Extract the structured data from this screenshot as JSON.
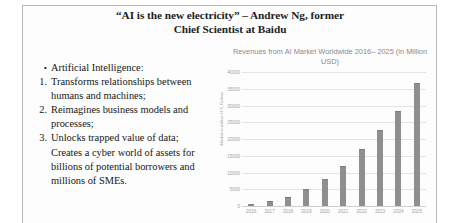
{
  "slide": {
    "title_lines": [
      "“AI is the new electricity” – Andrew Ng, former",
      "Chief Scientist at Baidu"
    ],
    "border_color": "#b9b9b9",
    "background": "#ffffff"
  },
  "content": {
    "items": [
      {
        "marker": "•",
        "marker_type": "bullet",
        "text": "Artificial Intelligence:"
      },
      {
        "marker": "1.",
        "marker_type": "number",
        "text": "Transforms relationships between humans and machines;"
      },
      {
        "marker": "2.",
        "marker_type": "number",
        "text": "Reimagines business models and processes;"
      },
      {
        "marker": "3.",
        "marker_type": "number",
        "text": "Unlocks trapped value of data; Creates a cyber world of assets for billions of potential borrowers and millions of SMEs."
      }
    ]
  },
  "chart_data": {
    "type": "bar",
    "title_lines": [
      "Revenues from AI Market Worldwide 2016–",
      "2025 (in Million USD)"
    ],
    "xlabel": "",
    "ylabel": "Market in million U.S. Dollars",
    "categories": [
      "2016",
      "2017",
      "2018",
      "2019",
      "2020",
      "2021",
      "2022",
      "2023",
      "2024",
      "2025"
    ],
    "values": [
      700,
      1400,
      2800,
      5100,
      8100,
      12000,
      17000,
      22600,
      28500,
      36800
    ],
    "ylim": [
      0,
      40000
    ],
    "yticks": [
      0,
      5000,
      10000,
      15000,
      20000,
      25000,
      30000,
      35000,
      40000
    ],
    "ytick_labels": [
      "0",
      "5000",
      "10000",
      "15000",
      "20000",
      "25000",
      "30000",
      "35000",
      "40000"
    ],
    "grid": true,
    "legend": false,
    "bar_color": "#8f8f8f",
    "gridline_color": "#e4e4e4",
    "axis_text_color": "#a2a2a2"
  }
}
